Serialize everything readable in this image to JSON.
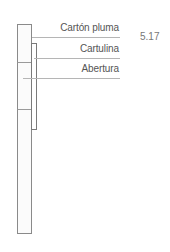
{
  "figure": {
    "number": "5.17",
    "labels": [
      {
        "id": "carton-pluma",
        "text": "Cartón pluma"
      },
      {
        "id": "cartulina",
        "text": "Cartulina"
      },
      {
        "id": "abertura",
        "text": "Abertura"
      }
    ]
  },
  "colors": {
    "line": "#8a8a8a",
    "leader": "#b5b5b5",
    "text": "#555555"
  }
}
